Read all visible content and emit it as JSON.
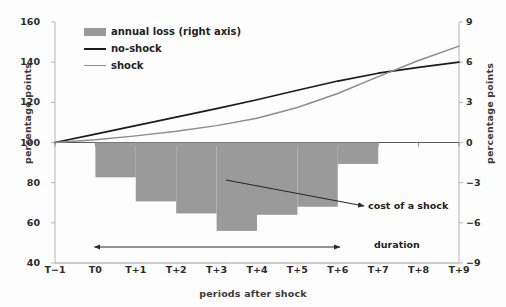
{
  "chart_data": {
    "type": "bar",
    "title": "",
    "subtitle": "",
    "xlabel": "periods after shock",
    "ylabel": "percentage points",
    "ylabel_right": "percentage  points",
    "categories": [
      "T−1",
      "T0",
      "T+1",
      "T+2",
      "T+3",
      "T+4",
      "T+5",
      "T+6",
      "T+7",
      "T+8",
      "T+9"
    ],
    "ylim": [
      40,
      160
    ],
    "yticks": [
      160,
      140,
      120,
      100,
      80,
      60,
      40
    ],
    "ylim_right": [
      -9,
      9
    ],
    "yticks_right": [
      9,
      6,
      3,
      0,
      "−3",
      "−6",
      "−9"
    ],
    "grid": false,
    "legend_position": "upper-left",
    "series": [
      {
        "name": "annual loss (right axis)",
        "kind": "bar",
        "axis": "right",
        "color": "#9a9a9a",
        "values": [
          null,
          -2.6,
          -4.4,
          -5.3,
          -6.6,
          -5.4,
          -4.8,
          -1.6,
          null,
          null,
          null
        ]
      },
      {
        "name": "no-shock",
        "kind": "line",
        "axis": "left",
        "color": "#1b1b1b",
        "values": [
          100.0,
          104.2,
          108.4,
          112.6,
          116.9,
          121.3,
          126.0,
          130.6,
          134.5,
          137.4,
          140.0
        ]
      },
      {
        "name": "shock",
        "kind": "line",
        "axis": "left",
        "color": "#8d8d8d",
        "values": [
          100.0,
          101.4,
          103.3,
          105.6,
          108.4,
          112.1,
          117.4,
          124.4,
          132.8,
          140.8,
          148.0
        ]
      }
    ],
    "annotations": [
      {
        "text": "cost of a shock",
        "kind": "arrow-label",
        "points_to": "T+3 bar region"
      },
      {
        "text": "duration",
        "kind": "arrow-label",
        "points_to": "T0 to T+7 span"
      }
    ]
  },
  "legend": {
    "items": [
      {
        "label": "annual loss (right axis)",
        "marker": "swatch"
      },
      {
        "label": "no-shock",
        "marker": "line-black"
      },
      {
        "label": "shock",
        "marker": "line-grey"
      }
    ]
  },
  "colors": {
    "bar": "#9a9a9a",
    "no_shock_line": "#1b1b1b",
    "shock_line": "#8d8d8d",
    "axis": "#b5b5b5",
    "text": "#1f1f1f",
    "background": "#fdfdfd"
  }
}
